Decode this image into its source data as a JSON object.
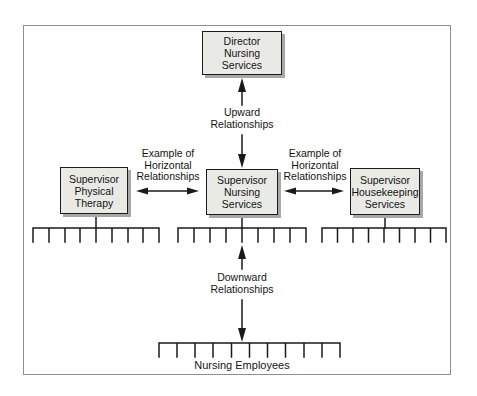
{
  "diagram": {
    "nodes": {
      "director": {
        "label": "Director\nNursing\nServices"
      },
      "supervisor_physical_therapy": {
        "label": "Supervisor\nPhysical\nTherapy"
      },
      "supervisor_nursing_services": {
        "label": "Supervisor\nNursing\nServices"
      },
      "supervisor_housekeeping_services": {
        "label": "Supervisor\nHousekeeping\nServices"
      },
      "nursing_employees": {
        "label": "Nursing Employees"
      }
    },
    "annotations": {
      "upward": "Upward\nRelationships",
      "downward": "Downward\nRelationships",
      "horizontal_left": "Example of\nHorizontal\nRelationships",
      "horizontal_right": "Example of\nHorizontal\nRelationships"
    },
    "colors": {
      "background": "#ffffff",
      "frame_border": "#8f8f8f",
      "box_fill": "#e9e9e6",
      "box_border": "#1c1c1c",
      "box_shadow": "#a8a8a8",
      "line": "#1a1a1a"
    }
  }
}
